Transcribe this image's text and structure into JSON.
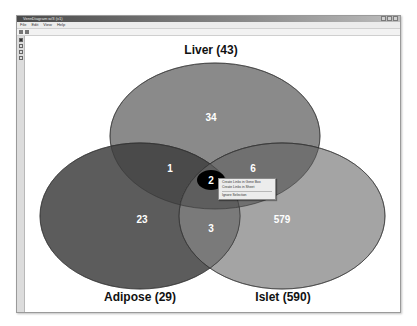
{
  "window": {
    "title": "VennDiagram w/3 (v1)",
    "controls": [
      "minimize",
      "maximize",
      "close"
    ]
  },
  "menubar": [
    "File",
    "Edit",
    "View",
    "Help"
  ],
  "toolbar": {
    "icons": [
      "open-icon",
      "save-icon"
    ]
  },
  "lefttools": [
    "pointer-tool-icon",
    "zoom-tool-icon",
    "hand-tool-icon",
    "select-tool-icon"
  ],
  "venn": {
    "sets": [
      {
        "name": "Liver",
        "label": "Liver (43)",
        "total": 43,
        "color": "#8a8a8a"
      },
      {
        "name": "Adipose",
        "label": "Adipose (29)",
        "total": 29,
        "color": "#5c5c5c"
      },
      {
        "name": "Islet",
        "label": "Islet (590)",
        "total": 590,
        "color": "#a4a4a4"
      }
    ],
    "regions": {
      "liver_only": "34",
      "adipose_only": "23",
      "islet_only": "579",
      "liver_adipose": "1",
      "liver_islet": "6",
      "adipose_islet": "3",
      "all_three": "2"
    },
    "selected_region_color": "#000000"
  },
  "context_menu": {
    "items": [
      "Create Links in Gene Box",
      "Create Links in Sheet",
      "Ignore Selection"
    ]
  }
}
